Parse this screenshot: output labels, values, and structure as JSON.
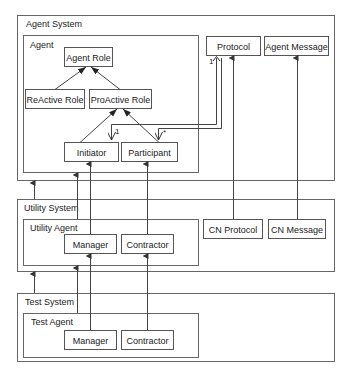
{
  "diagram": {
    "packages": {
      "agent_system": "Agent System",
      "agent": "Agent",
      "utility_system": "Utility System",
      "utility_agent": "Utility Agent",
      "test_system": "Test System",
      "test_agent": "Test Agent"
    },
    "classes": {
      "agent_role": "Agent Role",
      "reactive_role": "ReActive Role",
      "proactive_role": "ProActive Role",
      "initiator": "Initiator",
      "participant": "Participant",
      "protocol": "Protocol",
      "agent_message": "Agent Message",
      "utility_manager": "Manager",
      "utility_contractor": "Contractor",
      "cn_protocol": "CN Protocol",
      "cn_message": "CN Message",
      "test_manager": "Manager",
      "test_contractor": "Contractor"
    },
    "multiplicities": {
      "protocol_end": "1",
      "initiator_end": "1",
      "participant_end": "*"
    }
  }
}
